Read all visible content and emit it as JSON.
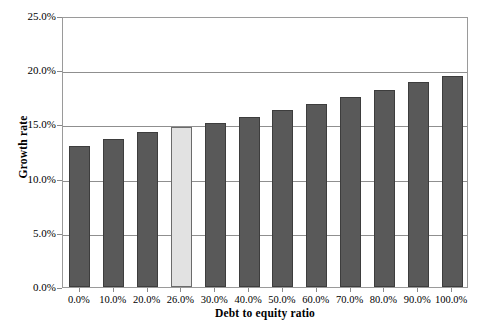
{
  "chart_data": {
    "type": "bar",
    "title": "",
    "xlabel": "Debt to equity ratio",
    "ylabel": "Growth rate",
    "categories": [
      "0.0%",
      "10.0%",
      "20.0%",
      "26.0%",
      "30.0%",
      "40.0%",
      "50.0%",
      "60.0%",
      "70.0%",
      "80.0%",
      "90.0%",
      "100.0%"
    ],
    "values": [
      13.0,
      13.7,
      14.3,
      14.8,
      15.1,
      15.7,
      16.3,
      16.9,
      17.5,
      18.2,
      18.9,
      19.5
    ],
    "value_labels": [
      "13.0%",
      "13.7%",
      "14.3%",
      "14.8%",
      "15.1%",
      "15.7%",
      "16.3%",
      "16.9%",
      "17.5%",
      "18.2%",
      "18.9%",
      "19.5%"
    ],
    "highlight_index": 3,
    "highlight_category": "26.0%",
    "ylim": [
      0,
      25
    ],
    "xlim_note": "categorical",
    "ytick_labels": [
      "0.0%",
      "5.0%",
      "10.0%",
      "15.0%",
      "20.0%",
      "25.0%"
    ],
    "ytick_values": [
      0,
      5,
      10,
      15,
      20,
      25
    ],
    "grid": true,
    "grid_axis": "y",
    "legend": "none",
    "colors": {
      "bar": "#595959",
      "bar_border": "#3d3d3d",
      "bar_highlight": "#e2e2e2",
      "bar_highlight_border": "#6b6b6b",
      "gridline": "#8f8f8f",
      "axis": "#9a9a9a",
      "background": "#ffffff",
      "text": "#000000"
    }
  }
}
